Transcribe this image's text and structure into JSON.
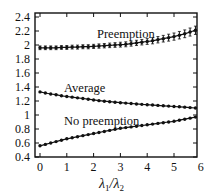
{
  "chart_data": {
    "type": "line",
    "title": "",
    "xlabel": "λ1/λ2",
    "ylabel": "",
    "xlim": [
      -0.2,
      5.85
    ],
    "ylim": [
      0.4,
      2.45
    ],
    "grid": false,
    "legend": "inline labels",
    "x_ticks": [
      "0",
      "1",
      "2",
      "3",
      "4",
      "5",
      "6"
    ],
    "y_ticks": [
      "0.4",
      "0.6",
      "0.8",
      "1",
      "1.2",
      "1.4",
      "1.6",
      "1.8",
      "2",
      "2.2",
      "2.4"
    ],
    "x": [
      0,
      0.2,
      0.4,
      0.6,
      0.8,
      1.0,
      1.2,
      1.4,
      1.6,
      1.8,
      2.0,
      2.2,
      2.4,
      2.6,
      2.8,
      3.0,
      3.2,
      3.4,
      3.6,
      3.8,
      4.0,
      4.2,
      4.4,
      4.6,
      4.8,
      5.0,
      5.2,
      5.4,
      5.6,
      5.8
    ],
    "series": [
      {
        "name": "Preemption",
        "values": [
          1.96,
          1.96,
          1.96,
          1.96,
          1.965,
          1.965,
          1.97,
          1.97,
          1.975,
          1.975,
          1.98,
          1.985,
          1.99,
          1.995,
          2.0,
          2.005,
          2.01,
          2.02,
          2.03,
          2.04,
          2.05,
          2.06,
          2.075,
          2.09,
          2.105,
          2.12,
          2.14,
          2.16,
          2.185,
          2.21
        ],
        "error": [
          0.005,
          0.005,
          0.005,
          0.005,
          0.005,
          0.006,
          0.006,
          0.007,
          0.007,
          0.008,
          0.008,
          0.009,
          0.01,
          0.011,
          0.012,
          0.013,
          0.014,
          0.015,
          0.016,
          0.018,
          0.02,
          0.022,
          0.024,
          0.026,
          0.028,
          0.03,
          0.032,
          0.034,
          0.036,
          0.038
        ]
      },
      {
        "name": "Average",
        "values": [
          1.33,
          1.315,
          1.3,
          1.29,
          1.275,
          1.265,
          1.255,
          1.245,
          1.235,
          1.225,
          1.215,
          1.205,
          1.197,
          1.19,
          1.183,
          1.176,
          1.17,
          1.164,
          1.158,
          1.152,
          1.147,
          1.142,
          1.137,
          1.132,
          1.127,
          1.122,
          1.117,
          1.112,
          1.106,
          1.1
        ]
      },
      {
        "name": "No preemption",
        "values": [
          0.56,
          0.58,
          0.6,
          0.62,
          0.64,
          0.66,
          0.675,
          0.69,
          0.705,
          0.72,
          0.735,
          0.75,
          0.765,
          0.78,
          0.795,
          0.81,
          0.82,
          0.83,
          0.84,
          0.85,
          0.86,
          0.87,
          0.88,
          0.89,
          0.9,
          0.91,
          0.925,
          0.94,
          0.955,
          0.97
        ]
      }
    ],
    "annotations": [
      {
        "text": "Preemption",
        "x": 2.1,
        "y": 2.12
      },
      {
        "text": "Average",
        "x": 1.8,
        "y": 1.38
      },
      {
        "text": "No preemption",
        "x": 1.8,
        "y": 0.9
      }
    ]
  },
  "labels": {
    "xlabel_main": "λ",
    "xlabel_sub1": "1",
    "xlabel_slash": "/λ",
    "xlabel_sub2": "2",
    "preemption": "Preemption",
    "average": "Average",
    "no_preemption": "No preemption"
  }
}
